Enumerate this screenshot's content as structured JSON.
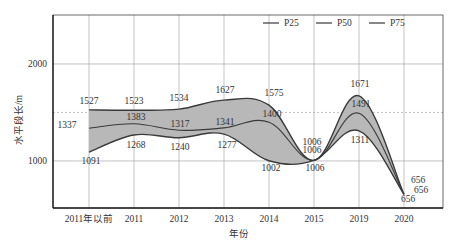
{
  "chart_data": {
    "type": "line",
    "title": "",
    "xlabel": "年份",
    "ylabel": "水平段长/m",
    "categories": [
      "2011年以前",
      "2011",
      "2012",
      "2013",
      "2014",
      "2015",
      "2019",
      "2020"
    ],
    "series": [
      {
        "name": "P25",
        "values": [
          1091,
          1268,
          1240,
          1277,
          1002,
          1006,
          1311,
          656
        ]
      },
      {
        "name": "P50",
        "values": [
          1337,
          1383,
          1317,
          1341,
          1400,
          1006,
          1491,
          656
        ]
      },
      {
        "name": "P75",
        "values": [
          1527,
          1523,
          1534,
          1627,
          1575,
          1006,
          1671,
          656
        ]
      }
    ],
    "yticks": [
      1000,
      2000
    ],
    "ylim": [
      515,
      2505
    ],
    "reference_line": 1500,
    "fill_between": [
      "P25",
      "P75"
    ],
    "grid": true,
    "legend_position": "top-right",
    "data_labels": true
  },
  "legend": {
    "items": [
      "P25",
      "P50",
      "P75"
    ]
  },
  "axes": {
    "x_title": "年份",
    "y_title": "水平段长/m",
    "y_tick_labels": [
      "1000",
      "2000"
    ]
  },
  "colors": {
    "line": "#3a3a3a",
    "fill": "#b8b8b8",
    "grid": "#9a9a9a",
    "reference": "#999999"
  }
}
